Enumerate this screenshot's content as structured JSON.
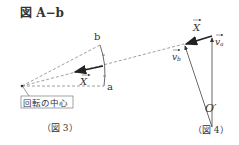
{
  "title": "図 A−b",
  "figure3": {
    "caption": "（図 3）",
    "label_a": "a",
    "label_b": "b",
    "vector_X": "X",
    "center_label": "回転の中心"
  },
  "figure4": {
    "caption": "（図 4）",
    "vector_X": "X",
    "vector_va": "v",
    "va_sub": "a",
    "vector_vb": "v",
    "vb_sub": "b",
    "origin": "O′"
  },
  "colors": {
    "line": "#444444",
    "dashed": "#888888",
    "text": "#333333"
  }
}
